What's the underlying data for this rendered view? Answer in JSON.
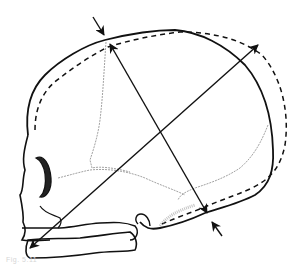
{
  "figure": {
    "colors": {
      "line": "#111111",
      "suture": "#8a8a8a",
      "background": "#ffffff"
    },
    "elements": [
      {
        "name": "skull-outline",
        "style": "solid"
      },
      {
        "name": "alternate-outline",
        "style": "dashed"
      },
      {
        "name": "diameter-arrow-1",
        "from": "lower-front (chin)",
        "to": "upper-back",
        "style": "double-headed"
      },
      {
        "name": "diameter-arrow-2",
        "from": "top (vertex)",
        "to": "lower-back (occiput)",
        "style": "double-headed"
      },
      {
        "name": "pointer-arrow-top",
        "target": "vertex"
      },
      {
        "name": "pointer-arrow-bottom",
        "target": "occiput"
      }
    ]
  },
  "caption": {
    "text": "Fig. 5.11"
  }
}
